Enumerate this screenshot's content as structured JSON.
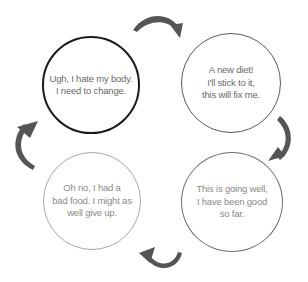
{
  "diagram": {
    "type": "cycle",
    "nodes": [
      {
        "id": "hate-body",
        "text": "Ugh, I hate my body.\nI need to change.",
        "border_color": "#1a1a1a"
      },
      {
        "id": "new-diet",
        "text": "A new diet!\nI'll stick to it,\nthis will fix me.",
        "border_color": "#5a5a5a"
      },
      {
        "id": "going-well",
        "text": "This is going well,\nI have been good\nso far.",
        "border_color": "#707070"
      },
      {
        "id": "give-up",
        "text": "Oh no, I had a\nbad food. I might as\nwell give up.",
        "border_color": "#a8a8a8"
      }
    ],
    "edges": [
      {
        "from": "hate-body",
        "to": "new-diet",
        "icon": "curved-arrow-icon"
      },
      {
        "from": "new-diet",
        "to": "going-well",
        "icon": "curved-arrow-icon"
      },
      {
        "from": "going-well",
        "to": "give-up",
        "icon": "curved-arrow-icon"
      },
      {
        "from": "give-up",
        "to": "hate-body",
        "icon": "curved-arrow-icon"
      }
    ],
    "arrow_color": "#555555"
  }
}
